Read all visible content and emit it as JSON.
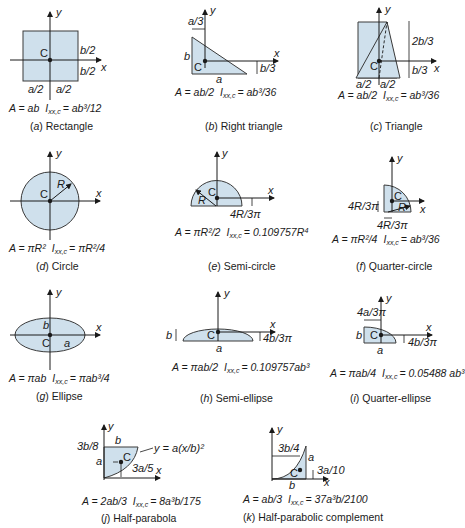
{
  "figure": {
    "colors": {
      "fill": "#cfe0ec",
      "stroke": "#3a3a3a",
      "text": "#1a1a1a"
    },
    "panels": [
      {
        "id": "a",
        "caption_letter": "a",
        "caption": "Rectangle",
        "labels": [
          "y",
          "x",
          "C",
          "b/2",
          "b/2",
          "a/2",
          "a/2"
        ],
        "area": "A = ab",
        "inertia_label": "I",
        "inertia_sub": "xx,c",
        "inertia": "= ab³/12"
      },
      {
        "id": "b",
        "caption_letter": "b",
        "caption": "Right triangle",
        "labels": [
          "y",
          "x",
          "C",
          "a/3",
          "b",
          "b/3",
          "a"
        ],
        "area": "A = ab/2",
        "inertia_label": "I",
        "inertia_sub": "xx,c",
        "inertia": "= ab³/36"
      },
      {
        "id": "c",
        "caption_letter": "c",
        "caption": "Triangle",
        "labels": [
          "y",
          "x",
          "C",
          "2b/3",
          "b/3",
          "a/2",
          "a/2"
        ],
        "area": "A = ab/2",
        "inertia_label": "I",
        "inertia_sub": "xx,c",
        "inertia": "= ab³/36"
      },
      {
        "id": "d",
        "caption_letter": "d",
        "caption": "Circle",
        "labels": [
          "y",
          "x",
          "C",
          "R"
        ],
        "area": "A = πR²",
        "inertia_label": "I",
        "inertia_sub": "xx,c",
        "inertia": "= πR²/4"
      },
      {
        "id": "e",
        "caption_letter": "e",
        "caption": "Semi-circle",
        "labels": [
          "y",
          "x",
          "C",
          "R",
          "4R/3π"
        ],
        "area": "A = πR²/2",
        "inertia_label": "I",
        "inertia_sub": "xx,c",
        "inertia": "= 0.109757R⁴"
      },
      {
        "id": "f",
        "caption_letter": "f",
        "caption": "Quarter-circle",
        "labels": [
          "y",
          "x",
          "C",
          "R",
          "4R/3π",
          "4R/3π"
        ],
        "area": "A = πR²/4",
        "inertia_label": "I",
        "inertia_sub": "xx,c",
        "inertia": "= ab³/36"
      },
      {
        "id": "g",
        "caption_letter": "g",
        "caption": "Ellipse",
        "labels": [
          "y",
          "x",
          "C",
          "b",
          "a"
        ],
        "area": "A = πab",
        "inertia_label": "I",
        "inertia_sub": "xx,c",
        "inertia": "= πab³/4"
      },
      {
        "id": "h",
        "caption_letter": "h",
        "caption": "Semi-ellipse",
        "labels": [
          "y",
          "x",
          "C",
          "b",
          "a",
          "4b/3π"
        ],
        "area": "A = πab/2",
        "inertia_label": "I",
        "inertia_sub": "xx,c",
        "inertia": "= 0.109757ab³"
      },
      {
        "id": "i",
        "caption_letter": "i",
        "caption": "Quarter-ellipse",
        "labels": [
          "y",
          "x",
          "C",
          "4a/3π",
          "b",
          "a",
          "4b/3π"
        ],
        "area": "A = πab/4",
        "inertia_label": "I",
        "inertia_sub": "xx,c",
        "inertia": "= 0.05488 ab³"
      },
      {
        "id": "j",
        "caption_letter": "j",
        "caption": "Half-parabola",
        "labels": [
          "y",
          "x",
          "C",
          "b",
          "3b/8",
          "a",
          "3a/5",
          "y = a(x/b)²"
        ],
        "area": "A = 2ab/3",
        "inertia_label": "I",
        "inertia_sub": "xx,c",
        "inertia": "= 8a³b/175"
      },
      {
        "id": "k",
        "caption_letter": "k",
        "caption": "Half-parabolic complement",
        "labels": [
          "y",
          "x",
          "C",
          "3b/4",
          "a",
          "3a/10",
          "b"
        ],
        "area": "A = ab/3",
        "inertia_label": "I",
        "inertia_sub": "xx,c",
        "inertia": "= 37a³b/2100"
      }
    ]
  }
}
